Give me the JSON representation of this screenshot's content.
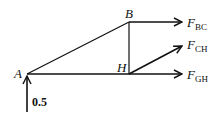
{
  "diagram": {
    "type": "free-body-diagram",
    "nodes": {
      "A": {
        "label": "A",
        "x": 27,
        "y": 74
      },
      "B": {
        "label": "B",
        "x": 129,
        "y": 22
      },
      "H": {
        "label": "H",
        "x": 129,
        "y": 74
      }
    },
    "members": [
      {
        "from": "A",
        "to": "B"
      },
      {
        "from": "B",
        "to": "H"
      },
      {
        "from": "A",
        "to": "H"
      }
    ],
    "forces": [
      {
        "id": "FBC",
        "main": "F",
        "sub": "BC",
        "from": "B",
        "direction": "horizontal"
      },
      {
        "id": "FCH",
        "main": "F",
        "sub": "CH",
        "from": "H",
        "direction": "diagonal-up"
      },
      {
        "id": "FGH",
        "main": "F",
        "sub": "GH",
        "from": "H",
        "direction": "horizontal"
      }
    ],
    "reaction": {
      "at": "A",
      "direction": "up",
      "value": "0.5"
    },
    "color": "#111111"
  }
}
